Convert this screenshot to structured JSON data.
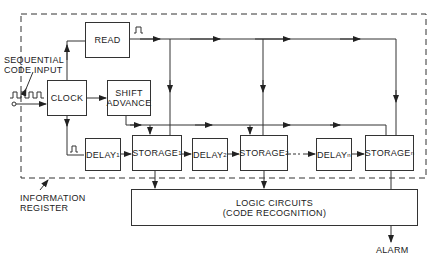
{
  "diagram": {
    "type": "block-diagram",
    "container_label": [
      "INFORMATION",
      "REGISTER"
    ],
    "input_label": [
      "SEQUENTIAL",
      "CODE INPUT"
    ],
    "output_label": "ALARM",
    "blocks": {
      "read": "READ",
      "clock": "CLOCK",
      "shift_advance": [
        "SHIFT",
        "ADVANCE"
      ],
      "delay1": {
        "base": "DELAY",
        "sub": "1"
      },
      "storage1": {
        "base": "STORAGE",
        "sub": "1"
      },
      "delay2": {
        "base": "DELAY",
        "sub": "2"
      },
      "storage2": {
        "base": "STORAGE",
        "sub": "2"
      },
      "delayn": {
        "base": "DELAY",
        "sub": "n"
      },
      "storagen": {
        "base": "STORAGE",
        "sub": "n"
      },
      "logic": [
        "LOGIC CIRCUITS",
        "(CODE RECOGNITION)"
      ]
    },
    "edges": [
      [
        "input",
        "clock"
      ],
      [
        "clock",
        "read"
      ],
      [
        "clock",
        "shift_advance"
      ],
      [
        "clock",
        "delay1"
      ],
      [
        "read",
        "storage1"
      ],
      [
        "read",
        "storage2"
      ],
      [
        "read",
        "storagen"
      ],
      [
        "shift_advance",
        "storage1"
      ],
      [
        "shift_advance",
        "storage2"
      ],
      [
        "shift_advance",
        "storagen"
      ],
      [
        "delay1",
        "storage1"
      ],
      [
        "storage1",
        "delay2"
      ],
      [
        "delay2",
        "storage2"
      ],
      [
        "storage2",
        "delayn"
      ],
      [
        "delayn",
        "storagen"
      ],
      [
        "storage1",
        "logic"
      ],
      [
        "storage2",
        "logic"
      ],
      [
        "storagen",
        "logic"
      ],
      [
        "logic",
        "alarm"
      ]
    ]
  }
}
